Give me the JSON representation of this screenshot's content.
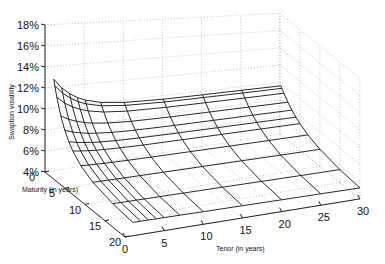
{
  "chart_data": {
    "type": "surface",
    "title": "",
    "zlabel": "Swaption volatility",
    "xlabel": "Tenor (in years)",
    "ylabel": "Maturity (in years)",
    "z_ticks": [
      "4%",
      "6%",
      "8%",
      "10%",
      "12%",
      "14%",
      "16%",
      "18%"
    ],
    "x_ticks": [
      "0",
      "5",
      "10",
      "15",
      "20",
      "25",
      "30"
    ],
    "y_ticks": [
      "0",
      "5",
      "10",
      "15",
      "20"
    ],
    "zlim": [
      4,
      18
    ],
    "xlim": [
      0,
      30
    ],
    "ylim": [
      0,
      20
    ],
    "grid": true,
    "maturities": [
      0.25,
      0.5,
      1,
      2,
      3,
      4,
      5,
      7,
      10,
      15,
      20
    ],
    "tenors": [
      1,
      2,
      3,
      4,
      5,
      7,
      10,
      15,
      20,
      25,
      30
    ],
    "volatility_note": "Peak ~15.7% at shortest maturity/tenor, decaying to ~5-6% at long maturities, ~9.5-10% along back edge"
  }
}
